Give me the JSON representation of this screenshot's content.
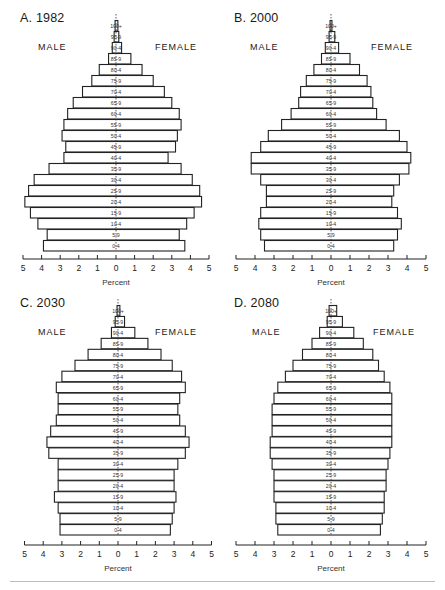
{
  "figure": {
    "age_groups": [
      "100+",
      "95-9",
      "90-4",
      "85-9",
      "80-4",
      "75-9",
      "70-4",
      "65-9",
      "60-4",
      "55-9",
      "50-4",
      "45-9",
      "40-4",
      "35-9",
      "30-4",
      "25-9",
      "20-4",
      "15-9",
      "10-4",
      "5-9",
      "0-4"
    ],
    "male_label": "MALE",
    "female_label": "FEMALE",
    "x_axis_label": "Percent",
    "x_ticks": [
      "5",
      "4",
      "3",
      "2",
      "1",
      "0",
      "1",
      "2",
      "3",
      "4",
      "5"
    ]
  },
  "panels": [
    {
      "title": "A. 1982"
    },
    {
      "title": "B. 2000"
    },
    {
      "title": "C. 2030"
    },
    {
      "title": "D. 2080"
    }
  ],
  "chart_data": [
    {
      "type": "bar",
      "title": "A. 1982",
      "orientation": "population-pyramid",
      "categories": [
        "100+",
        "95-99",
        "90-94",
        "85-89",
        "80-84",
        "75-79",
        "70-74",
        "65-69",
        "60-64",
        "55-59",
        "50-54",
        "45-49",
        "40-44",
        "35-39",
        "30-34",
        "25-29",
        "20-24",
        "15-19",
        "10-14",
        "5-9",
        "0-4"
      ],
      "series": [
        {
          "name": "MALE",
          "values": [
            0.05,
            0.1,
            0.2,
            0.4,
            0.9,
            1.3,
            1.8,
            2.3,
            2.6,
            2.8,
            2.9,
            2.7,
            2.8,
            3.6,
            4.4,
            4.7,
            4.9,
            4.6,
            4.2,
            3.7,
            3.9
          ]
        },
        {
          "name": "FEMALE",
          "values": [
            0.1,
            0.15,
            0.3,
            0.8,
            1.4,
            2.0,
            2.6,
            3.0,
            3.4,
            3.5,
            3.3,
            3.2,
            2.8,
            3.5,
            4.1,
            4.5,
            4.6,
            4.2,
            3.8,
            3.4,
            3.7
          ]
        }
      ],
      "xlabel": "Percent",
      "ylabel": "",
      "xlim": [
        -5,
        5
      ],
      "grid": false,
      "legend": "MALE left / FEMALE right"
    },
    {
      "type": "bar",
      "title": "B. 2000",
      "orientation": "population-pyramid",
      "categories": [
        "100+",
        "95-99",
        "90-94",
        "85-89",
        "80-84",
        "75-79",
        "70-74",
        "65-69",
        "60-64",
        "55-59",
        "50-54",
        "45-49",
        "40-44",
        "35-39",
        "30-34",
        "25-29",
        "20-24",
        "15-19",
        "10-14",
        "5-9",
        "0-4"
      ],
      "series": [
        {
          "name": "MALE",
          "values": [
            0.05,
            0.1,
            0.3,
            0.5,
            0.9,
            1.3,
            1.6,
            1.7,
            2.1,
            2.6,
            3.3,
            3.7,
            4.2,
            4.2,
            3.7,
            3.4,
            3.4,
            3.7,
            3.8,
            3.7,
            3.5
          ]
        },
        {
          "name": "FEMALE",
          "values": [
            0.05,
            0.2,
            0.4,
            1.0,
            1.5,
            1.9,
            2.1,
            2.2,
            2.4,
            2.9,
            3.6,
            4.0,
            4.2,
            4.1,
            3.6,
            3.3,
            3.2,
            3.5,
            3.7,
            3.5,
            3.3
          ]
        }
      ],
      "xlabel": "Percent",
      "ylabel": "",
      "xlim": [
        -5,
        5
      ],
      "grid": false,
      "legend": "MALE left / FEMALE right"
    },
    {
      "type": "bar",
      "title": "C. 2030",
      "orientation": "population-pyramid",
      "categories": [
        "100+",
        "95-99",
        "90-94",
        "85-89",
        "80-84",
        "75-79",
        "70-74",
        "65-69",
        "60-64",
        "55-59",
        "50-54",
        "45-49",
        "40-44",
        "35-39",
        "30-34",
        "25-29",
        "20-24",
        "15-19",
        "10-14",
        "5-9",
        "0-4"
      ],
      "series": [
        {
          "name": "MALE",
          "values": [
            0.05,
            0.15,
            0.35,
            0.9,
            1.6,
            2.3,
            3.0,
            3.3,
            3.2,
            3.2,
            3.3,
            3.6,
            3.8,
            3.7,
            3.2,
            3.2,
            3.2,
            3.4,
            3.2,
            3.1,
            3.1
          ]
        },
        {
          "name": "FEMALE",
          "values": [
            0.1,
            0.35,
            0.9,
            1.6,
            2.3,
            2.9,
            3.4,
            3.6,
            3.3,
            3.2,
            3.3,
            3.6,
            3.8,
            3.6,
            3.2,
            3.0,
            3.0,
            3.1,
            3.0,
            2.9,
            2.8
          ]
        }
      ],
      "xlabel": "Percent",
      "ylabel": "",
      "xlim": [
        -5,
        5
      ],
      "grid": false,
      "legend": "MALE left / FEMALE right"
    },
    {
      "type": "bar",
      "title": "D. 2080",
      "orientation": "population-pyramid",
      "categories": [
        "100+",
        "95-99",
        "90-94",
        "85-89",
        "80-84",
        "75-79",
        "70-74",
        "65-69",
        "60-64",
        "55-59",
        "50-54",
        "45-49",
        "40-44",
        "35-39",
        "30-34",
        "25-29",
        "20-24",
        "15-19",
        "10-14",
        "5-9",
        "0-4"
      ],
      "series": [
        {
          "name": "MALE",
          "values": [
            0.1,
            0.2,
            0.6,
            1.0,
            1.5,
            2.0,
            2.4,
            2.8,
            3.0,
            3.1,
            3.1,
            3.1,
            3.2,
            3.2,
            3.1,
            3.0,
            3.0,
            3.0,
            2.9,
            2.9,
            2.8
          ]
        },
        {
          "name": "FEMALE",
          "values": [
            0.3,
            0.6,
            1.2,
            1.7,
            2.2,
            2.5,
            2.8,
            3.1,
            3.2,
            3.2,
            3.2,
            3.2,
            3.2,
            3.1,
            3.0,
            2.9,
            2.9,
            2.8,
            2.8,
            2.7,
            2.6
          ]
        }
      ],
      "xlabel": "Percent",
      "ylabel": "",
      "xlim": [
        -5,
        5
      ],
      "grid": false,
      "legend": "MALE left / FEMALE right"
    }
  ]
}
